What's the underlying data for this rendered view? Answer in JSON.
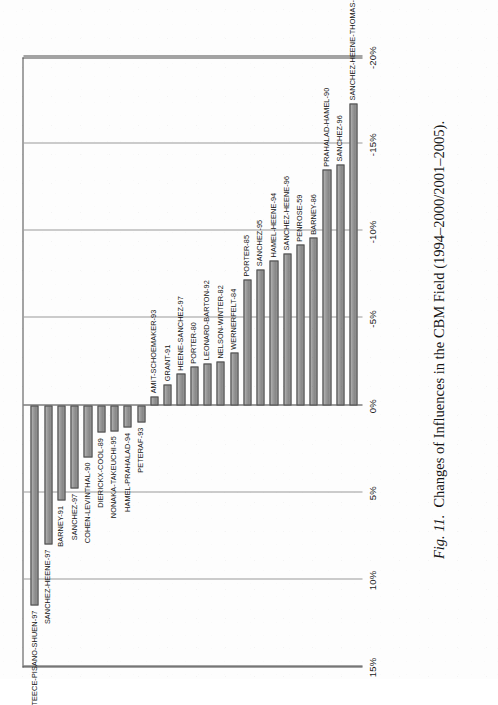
{
  "figure": {
    "number_label": "Fig. 11.",
    "caption": "Changes of Influences in the CBM Field (1994–2000/2001–2005)."
  },
  "chart_data": {
    "type": "bar",
    "orientation": "vertical-rendered-rotated",
    "title": "Changes of Influences in the CBM Field (1994–2000/2001–2005).",
    "xlabel": "",
    "ylabel": "",
    "grid": true,
    "legend": "none",
    "ylim": [
      -20,
      15
    ],
    "tick_labels": [
      "15%",
      "10%",
      "5%",
      "0%",
      "-5%",
      "-10%",
      "-15%",
      "-20%"
    ],
    "tick_values": [
      15,
      10,
      5,
      0,
      -5,
      -10,
      -15,
      -20
    ],
    "categories": [
      "TEECE-PISANO-SHUEN-97",
      "SANCHEZ-HEENE-97",
      "BARNEY-91",
      "SANCHEZ-97",
      "COHEN-LEVINTHAL-90",
      "DIERICKX-COOL-89",
      "NONAKA-TAKEUCHI-95",
      "HAMEL-PRAHALAD-94",
      "PETERAF-93",
      "AMIT-SCHOEMAKER-93",
      "GRANT-91",
      "HEENE-SANCHEZ-97",
      "PORTER-80",
      "LEONARD-BARTON-92",
      "NELSON-WINTER-82",
      "WERNERFELT-84",
      "PORTER-85",
      "SANCHEZ-95",
      "HAMEL-HEENE-94",
      "SANCHEZ-HEENE-96",
      "PENROSE-59",
      "BARNEY-86",
      "PRAHALAD-HAMEL-90",
      "SANCHEZ-96",
      "SANCHEZ-HEENE-THOMAS-96"
    ],
    "values": [
      11.5,
      8.0,
      5.5,
      4.8,
      3.0,
      1.6,
      1.5,
      1.3,
      1.0,
      -0.5,
      -1.2,
      -1.8,
      -2.2,
      -2.4,
      -2.5,
      -3.0,
      -7.2,
      -7.8,
      -8.3,
      -8.7,
      -9.2,
      -9.6,
      -13.5,
      -13.8,
      -17.3
    ],
    "bar_color": "#8e8e8e",
    "bar_border_color": "#4d4d4d",
    "axis_color": "#4a4a4a",
    "grid_color": "#9a9a9a"
  }
}
